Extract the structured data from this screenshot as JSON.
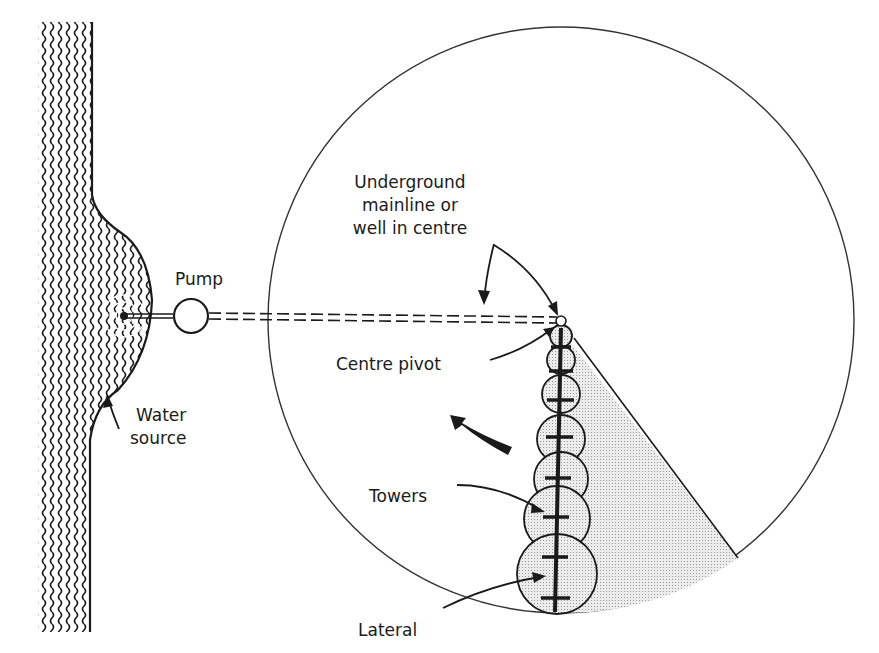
{
  "diagram": {
    "labels": {
      "pump": "Pump",
      "water_source_line1": "Water",
      "water_source_line2": "source",
      "mainline_line1": "Underground",
      "mainline_line2": "mainline or",
      "mainline_line3": "well in centre",
      "centre_pivot": "Centre pivot",
      "towers": "Towers",
      "lateral": "Lateral"
    },
    "colors": {
      "ink": "#1a1a1a",
      "irrigated_fill": "#d9d9d9",
      "background": "#ffffff"
    },
    "field": {
      "center_x": 561,
      "center_y": 321,
      "radius": 293
    },
    "tower_count": 7,
    "rotation": "counter-clockwise"
  }
}
